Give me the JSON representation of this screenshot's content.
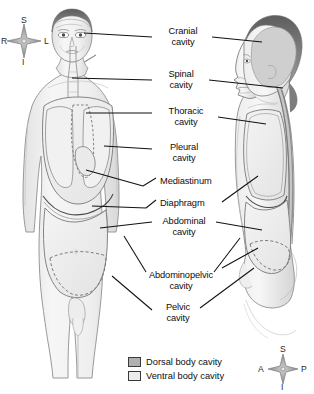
{
  "figure": {
    "background": "#ffffff"
  },
  "labels": [
    {
      "id": "cranial",
      "line1": "Cranial",
      "line2": "cavity"
    },
    {
      "id": "spinal",
      "line1": "Spinal",
      "line2": "cavity"
    },
    {
      "id": "thoracic",
      "line1": "Thoracic",
      "line2": "cavity"
    },
    {
      "id": "pleural",
      "line1": "Pleural",
      "line2": "cavity"
    },
    {
      "id": "mediastinum",
      "line1": "Mediastinum",
      "line2": ""
    },
    {
      "id": "diaphragm",
      "line1": "Diaphragm",
      "line2": ""
    },
    {
      "id": "abdominal",
      "line1": "Abdominal",
      "line2": "cavity"
    },
    {
      "id": "abdominopelvic",
      "line1": "Abdominopelvic",
      "line2": "cavity"
    },
    {
      "id": "pelvic",
      "line1": "Pelvic",
      "line2": "cavity"
    }
  ],
  "legend": {
    "items": [
      {
        "label": "Dorsal body cavity",
        "color": "#b0b0b0"
      },
      {
        "label": "Ventral body cavity",
        "color": "#ececec"
      }
    ]
  },
  "compass_left": {
    "name": "orientation-compass-anterior",
    "superior": "S",
    "inferior": "I",
    "right": "R",
    "left": "L"
  },
  "compass_right": {
    "name": "orientation-compass-lateral",
    "superior": "S",
    "inferior": "I",
    "anterior": "A",
    "posterior": "P"
  },
  "colors": {
    "dorsal_cavity": "#b0b0b0",
    "ventral_cavity": "#ececec",
    "skin": "#f2f2f2",
    "outline": "#6e6e6e",
    "leader_line": "#111111",
    "hair": "#6b6b6b",
    "text": "#0d0d0d"
  }
}
